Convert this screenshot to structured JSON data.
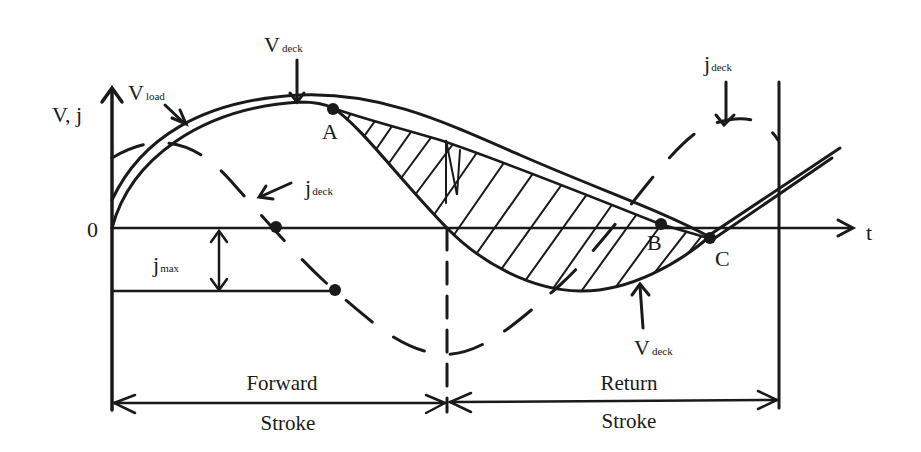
{
  "axes": {
    "y_label": "V, j",
    "x_label": "t",
    "origin_label": "0"
  },
  "labels": {
    "v_load": {
      "main": "V",
      "sub": "load"
    },
    "v_deck_top": {
      "main": "V",
      "sub": "deck"
    },
    "v_deck_bottom": {
      "main": "V",
      "sub": "deck"
    },
    "j_deck_left": {
      "main": "j",
      "sub": "deck"
    },
    "j_deck_right": {
      "main": "j",
      "sub": "deck"
    },
    "j_max": {
      "main": "j",
      "sub": "max"
    }
  },
  "points": {
    "a": "A",
    "b": "B",
    "c": "C"
  },
  "strokes": {
    "forward_top": "Forward",
    "forward_bottom": "Stroke",
    "return_top": "Return",
    "return_bottom": "Stroke"
  },
  "colors": {
    "ink": "#1a1a1a",
    "background": "#ffffff"
  }
}
